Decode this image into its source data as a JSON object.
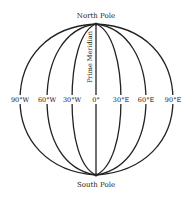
{
  "diagram": {
    "north_pole_label": "North Pole",
    "south_pole_label": "South Pole",
    "prime_meridian_label": "Prime Meridian",
    "meridians": [
      {
        "label": "90°W",
        "x": 20
      },
      {
        "label": "60°W",
        "x": 47
      },
      {
        "label": "30°W",
        "x": 72
      },
      {
        "label": "0°",
        "x": 96
      },
      {
        "label": "30°E",
        "x": 121
      },
      {
        "label": "60°E",
        "x": 146
      },
      {
        "label": "90°E",
        "x": 173
      }
    ],
    "line_color": "#222222",
    "background_color": "#ffffff"
  }
}
